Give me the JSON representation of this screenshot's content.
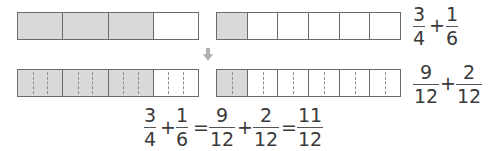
{
  "row1": {
    "bar_a": {
      "cells": 4,
      "shaded": 3
    },
    "bar_b": {
      "cells": 6,
      "shaded": 1
    },
    "expression": {
      "f1": {
        "num": "3",
        "den": "4"
      },
      "op": "+",
      "f2": {
        "num": "1",
        "den": "6"
      }
    }
  },
  "arrow": {
    "icon": "down-arrow-icon",
    "color": "#b0b0b0"
  },
  "row2": {
    "bar_a": {
      "cells": 4,
      "shaded": 3,
      "subdivisions": 3
    },
    "bar_b": {
      "cells": 6,
      "shaded": 1,
      "subdivisions": 2
    },
    "expression": {
      "f1": {
        "num": "9",
        "den": "12"
      },
      "op": "+",
      "f2": {
        "num": "2",
        "den": "12"
      }
    }
  },
  "equation": {
    "f1": {
      "num": "3",
      "den": "4"
    },
    "op1": "+",
    "f2": {
      "num": "1",
      "den": "6"
    },
    "eq1": "=",
    "f3": {
      "num": "9",
      "den": "12"
    },
    "op2": "+",
    "f4": {
      "num": "2",
      "den": "12"
    },
    "eq2": "=",
    "f5": {
      "num": "11",
      "den": "12"
    }
  },
  "colors": {
    "shade": "#d9d9d9",
    "border": "#6b6b6b",
    "text": "#3a3a3a"
  }
}
